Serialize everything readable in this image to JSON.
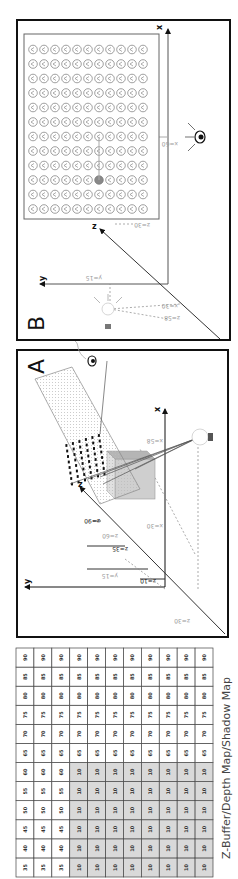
{
  "figure": {
    "rotation_deg": -90,
    "caption": "Z-Buffer/Depth Map/Shadow Map",
    "depth_map": {
      "rows": [
        [
          35,
          40,
          45,
          50,
          55,
          60,
          65,
          70,
          75,
          80,
          85,
          90
        ],
        [
          35,
          40,
          45,
          50,
          55,
          60,
          65,
          70,
          75,
          80,
          85,
          90
        ],
        [
          35,
          40,
          45,
          50,
          55,
          60,
          65,
          70,
          75,
          80,
          85,
          90
        ],
        [
          10,
          10,
          10,
          10,
          10,
          10,
          65,
          70,
          75,
          80,
          85,
          90
        ],
        [
          10,
          10,
          10,
          10,
          10,
          10,
          65,
          70,
          75,
          80,
          85,
          90
        ],
        [
          10,
          10,
          10,
          10,
          10,
          10,
          65,
          70,
          75,
          80,
          85,
          90
        ],
        [
          10,
          10,
          10,
          10,
          10,
          10,
          65,
          70,
          75,
          80,
          85,
          90
        ],
        [
          10,
          10,
          10,
          10,
          10,
          10,
          65,
          70,
          75,
          80,
          85,
          90
        ],
        [
          10,
          10,
          10,
          10,
          10,
          10,
          65,
          70,
          75,
          80,
          85,
          90
        ],
        [
          10,
          10,
          10,
          10,
          10,
          10,
          65,
          70,
          75,
          80,
          85,
          90
        ],
        [
          10,
          10,
          10,
          10,
          10,
          10,
          65,
          70,
          75,
          80,
          85,
          90
        ]
      ],
      "shaded_value": 10,
      "shade_color": "#d9d9d9"
    },
    "panel_a": {
      "label": "A",
      "axes": {
        "x": "x",
        "y": "y",
        "z": "z"
      },
      "annotations": {
        "z90": "z=90",
        "z60": "z=60",
        "z35": "z=35",
        "z10": "z=10",
        "y15": "y=15",
        "x30": "x=30",
        "x58": "x=58",
        "z30": "z=30"
      }
    },
    "panel_b": {
      "label": "B",
      "axes": {
        "x": "x",
        "y": "y",
        "z": "z"
      },
      "annotations": {
        "x60": "x=60",
        "z30": "z=30",
        "y15": "y=15",
        "z58": "z=58",
        "x30": "x=30"
      },
      "grid_rows": 11,
      "grid_cols": 12,
      "highlight": {
        "row": 6,
        "col": 2
      }
    }
  }
}
